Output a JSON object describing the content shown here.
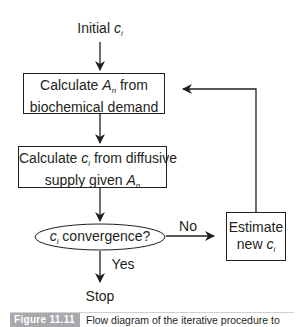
{
  "diagram": {
    "type": "flowchart",
    "start_label": {
      "text": "Initial ",
      "var": "c",
      "sub": "i"
    },
    "nodes": [
      {
        "id": "calc_an",
        "shape": "rect",
        "line1_pre": "Calculate ",
        "line1_var": "A",
        "line1_sub": "n",
        "line1_post": " from",
        "line2": "biochemical demand"
      },
      {
        "id": "calc_ci",
        "shape": "rect",
        "line1_pre": "Calculate ",
        "line1_var": "c",
        "line1_sub": "i",
        "line1_post": " from diffusive",
        "line2_pre": "supply given ",
        "line2_var": "A",
        "line2_sub": "n"
      },
      {
        "id": "convergence",
        "shape": "ellipse",
        "var": "c",
        "sub": "i",
        "post": " convergence?"
      },
      {
        "id": "estimate",
        "shape": "rect",
        "line1": "Estimate",
        "line2_pre": "new ",
        "line2_var": "c",
        "line2_sub": "i"
      }
    ],
    "edges": [
      {
        "from": "start",
        "to": "calc_an",
        "label": ""
      },
      {
        "from": "calc_an",
        "to": "calc_ci",
        "label": ""
      },
      {
        "from": "calc_ci",
        "to": "convergence",
        "label": ""
      },
      {
        "from": "convergence",
        "to": "estimate",
        "label": "No"
      },
      {
        "from": "estimate",
        "to": "calc_an",
        "label": ""
      },
      {
        "from": "convergence",
        "to": "stop",
        "label": "Yes"
      }
    ],
    "end_label": "Stop"
  },
  "caption": {
    "tag": "Figure 11.11",
    "text": "Flow diagram of the iterative procedure to"
  },
  "colors": {
    "stroke": "#231f20",
    "caption_tag_bg": "#a7a9ac",
    "caption_tag_text": "#ffffff"
  }
}
